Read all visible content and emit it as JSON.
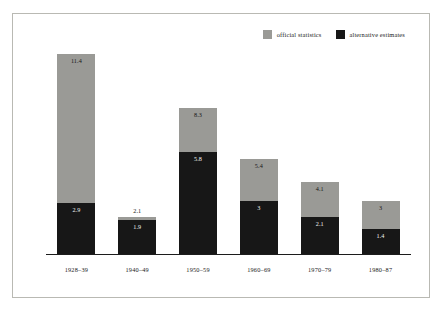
{
  "legend": {
    "items": [
      {
        "label": "official statistics",
        "color": "#9a9a96",
        "key": "official"
      },
      {
        "label": "alternative estimates",
        "color": "#171717",
        "key": "alternative"
      }
    ]
  },
  "chart_data": {
    "type": "bar",
    "title": "",
    "subtitle": "",
    "xlabel": "",
    "ylabel": "",
    "stacked": false,
    "overlaid": true,
    "grid": false,
    "legend_position": "top-right",
    "axis": {
      "baseline_visible": true,
      "yaxis_visible": false,
      "ylim": [
        0,
        11.4
      ]
    },
    "categories": [
      "1928–39",
      "1940–49",
      "1950–59",
      "1960–69",
      "1970–79",
      "1980–87"
    ],
    "series": [
      {
        "name": "official statistics",
        "color": "#9a9a96",
        "values": [
          11.4,
          2.1,
          8.3,
          5.4,
          4.1,
          3
        ]
      },
      {
        "name": "alternative estimates",
        "color": "#171717",
        "values": [
          2.9,
          1.9,
          5.8,
          3,
          2.1,
          1.4
        ]
      }
    ],
    "bars": [
      {
        "category": "1928–39",
        "official": {
          "value": 11.4,
          "label": "11.4"
        },
        "alternative": {
          "value": 2.9,
          "label": "2.9"
        },
        "official_label_outside": false
      },
      {
        "category": "1940–49",
        "official": {
          "value": 2.1,
          "label": "2.1"
        },
        "alternative": {
          "value": 1.9,
          "label": "1.9"
        },
        "official_label_outside": true
      },
      {
        "category": "1950–59",
        "official": {
          "value": 8.3,
          "label": "8.3"
        },
        "alternative": {
          "value": 5.8,
          "label": "5.8"
        },
        "official_label_outside": false
      },
      {
        "category": "1960–69",
        "official": {
          "value": 5.4,
          "label": "5.4"
        },
        "alternative": {
          "value": 3,
          "label": "3"
        },
        "official_label_outside": false
      },
      {
        "category": "1970–79",
        "official": {
          "value": 4.1,
          "label": "4.1"
        },
        "alternative": {
          "value": 2.1,
          "label": "2.1"
        },
        "official_label_outside": false
      },
      {
        "category": "1980–87",
        "official": {
          "value": 3,
          "label": "3"
        },
        "alternative": {
          "value": 1.4,
          "label": "1.4"
        },
        "official_label_outside": false
      }
    ]
  }
}
